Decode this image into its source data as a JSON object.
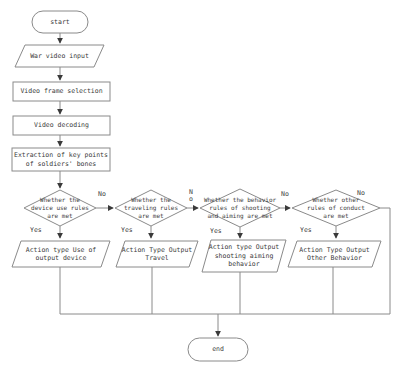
{
  "figure": {
    "type": "flowchart",
    "background": "#ffffff",
    "line_color": "#8a8a8a",
    "arrow_color": "#3a3a3a",
    "text_color": "#3b3b3b",
    "nodes": {
      "start": "start",
      "war_video_input": "War video input",
      "video_frame_selection": "Video frame selection",
      "video_decoding": "Video decoding",
      "extraction": "Extraction of key points\nof soldiers' bones",
      "decision_device": "Whether the\ndevice use rules\nare met",
      "decision_travel": "Whether the\ntraveling rules\nare met",
      "decision_shooting": "Whether the behavior\nrules of shooting\nand aiming are met",
      "decision_other": "Whether other\nrules of conduct\nare met",
      "action_device": "Action type Use of\noutput device",
      "action_travel": "Action Type Output\nTravel",
      "action_shooting": "Action type Output\nshooting aiming\nbehavior",
      "action_other": "Action Type Output\nOther Behavior",
      "end": "end"
    },
    "edge_labels": {
      "yes_device": "Yes",
      "yes_travel": "Yes",
      "yes_shooting": "Yes",
      "yes_other": "Yes",
      "no_device": "No",
      "no_travel": "No",
      "no_shooting": "No",
      "no_other": "No"
    }
  }
}
